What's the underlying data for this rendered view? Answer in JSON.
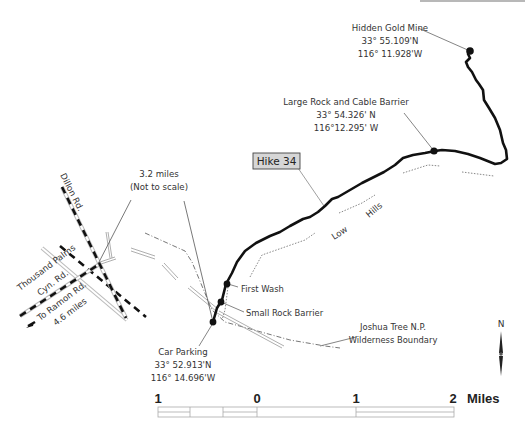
{
  "map": {
    "title_badge": "Hike 34",
    "points": {
      "hidden_gold_mine": {
        "name": "Hidden Gold Mine",
        "lat": "33° 55.109'N",
        "lon": "116° 11.928'W"
      },
      "large_rock_barrier": {
        "name": "Large Rock and Cable Barrier",
        "lat": "33° 54.326' N",
        "lon": "116°12.295' W"
      },
      "car_parking": {
        "name": "Car Parking",
        "lat": "33° 52.913'N",
        "lon": "116° 14.696'W"
      },
      "first_wash": {
        "name": "First Wash"
      },
      "small_rock_barrier": {
        "name": "Small Rock Barrier"
      }
    },
    "features": {
      "low_hills_1": "Low",
      "low_hills_2": "Hills",
      "boundary_line1": "Joshua Tree N.P.",
      "boundary_line2": "Wilderness Boundary"
    },
    "roads": {
      "dillon": "Dillon Rd.",
      "thousand_palms_1": "Thousand Palms",
      "thousand_palms_2": "Cyn. Rd.",
      "ramon_1": "To Ramon Rd.",
      "ramon_2": "4.6 miles"
    },
    "distance_note": {
      "line1": "3.2 miles",
      "line2": "(Not to scale)"
    },
    "north_label": "N",
    "scale_bar": {
      "labels": [
        "1",
        "0",
        "1",
        "2"
      ],
      "unit": "Miles"
    },
    "colors": {
      "trail": "#111111",
      "leader": "#555555",
      "road_dash": "#111111",
      "badge_bg": "#d6d6d6",
      "badge_border": "#444444"
    }
  }
}
